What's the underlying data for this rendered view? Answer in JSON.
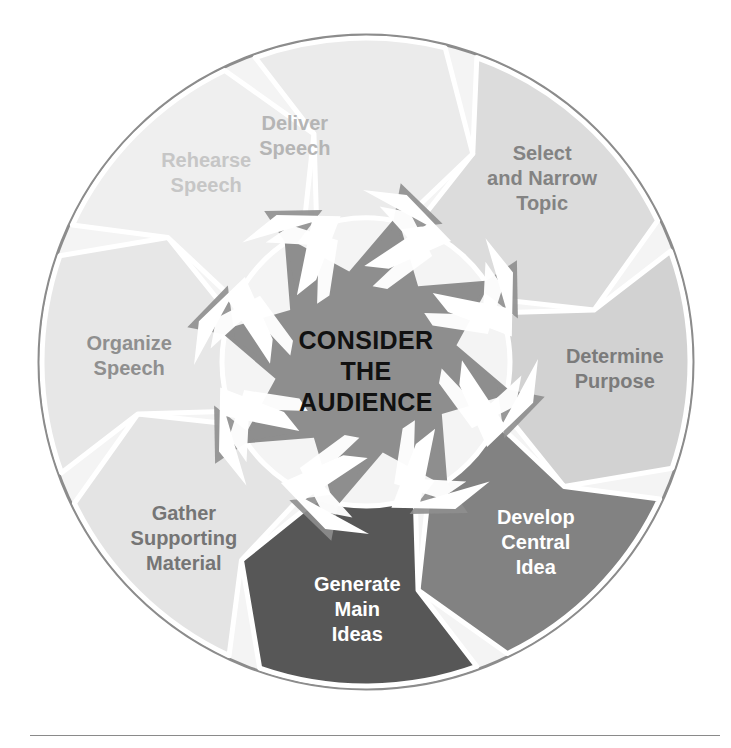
{
  "figure": {
    "type": "cycle-diagram",
    "title_center": [
      "CONSIDER",
      "THE",
      "AUDIENCE"
    ],
    "center_text_full": "CONSIDER THE AUDIENCE",
    "outer_ring_color": "#8c8c8c",
    "center_star_color": "#8e8e8e",
    "arrow_color": "#ffffff",
    "footer_rule_color": "#8a8a8a",
    "steps": [
      {
        "id": "select-and-narrow-topic",
        "lines": [
          "Select",
          "and Narrow",
          "Topic"
        ],
        "label": "Select and Narrow Topic",
        "fill": "#dcdcdc",
        "text_color": "#838383",
        "angle_start": -70,
        "angle_end": -20,
        "label_angle": -45,
        "order": 1
      },
      {
        "id": "determine-purpose",
        "lines": [
          "Determine",
          "Purpose"
        ],
        "label": "Determine Purpose",
        "fill": "#d2d2d2",
        "text_color": "#7b7b7b",
        "angle_start": -20,
        "angle_end": 25,
        "label_angle": 2,
        "order": 2
      },
      {
        "id": "develop-central-idea",
        "lines": [
          "Develop",
          "Central",
          "Idea"
        ],
        "label": "Develop Central Idea",
        "fill": "#828282",
        "text_color": "#ffffff",
        "angle_start": 25,
        "angle_end": 70,
        "label_angle": 47,
        "order": 3
      },
      {
        "id": "generate-main-ideas",
        "lines": [
          "Generate",
          "Main",
          "Ideas"
        ],
        "label": "Generate Main Ideas",
        "fill": "#575757",
        "text_color": "#ffffff",
        "angle_start": 70,
        "angle_end": 115,
        "label_angle": 92,
        "order": 4
      },
      {
        "id": "gather-supporting-material",
        "lines": [
          "Gather",
          "Supporting",
          "Material"
        ],
        "label": "Gather Supporting Material",
        "fill": "#e4e4e4",
        "text_color": "#757575",
        "angle_start": 115,
        "angle_end": 160,
        "label_angle": 137,
        "order": 5
      },
      {
        "id": "organize-speech",
        "lines": [
          "Organize",
          "Speech"
        ],
        "label": "Organize Speech",
        "fill": "#e7e7e7",
        "text_color": "#8f8f8f",
        "angle_start": 160,
        "angle_end": 205,
        "label_angle": 182,
        "order": 6
      },
      {
        "id": "rehearse-speech",
        "lines": [
          "Rehearse",
          "Speech"
        ],
        "label": "Rehearse Speech",
        "fill": "#efefef",
        "text_color": "#c6c6c6",
        "angle_start": 205,
        "angle_end": 250,
        "label_angle": 227,
        "order": 7
      },
      {
        "id": "deliver-speech",
        "lines": [
          "Deliver",
          "Speech"
        ],
        "label": "Deliver Speech",
        "fill": "#ebebeb",
        "text_color": "#b5b5b5",
        "angle_start": 250,
        "angle_end": 290,
        "label_angle": 249,
        "order": 8
      }
    ],
    "geometry": {
      "cx": 366,
      "cy": 362,
      "outer_radius": 328,
      "ring_inner_radius": 150,
      "star_outer_radius": 150,
      "star_inner_radius": 92
    }
  }
}
